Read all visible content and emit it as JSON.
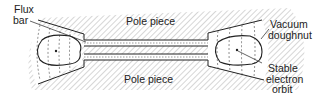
{
  "diagram": {
    "type": "betatron cross-section",
    "labels": {
      "flux_bar_line1": "Flux",
      "flux_bar_line2": "bar",
      "pole_top": "Pole piece",
      "pole_bottom": "Pole piece",
      "vacuum_line1": "Vacuum",
      "vacuum_line2": "doughnut",
      "orbit_line1": "Stable",
      "orbit_line2": "electron",
      "orbit_line3": "orbit"
    },
    "colors": {
      "line": "#222222",
      "hatch": "#8a8a8a",
      "background": "#ffffff"
    }
  }
}
